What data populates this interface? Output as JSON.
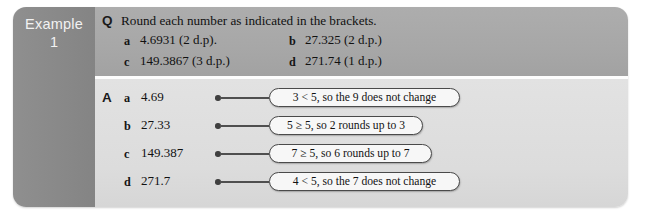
{
  "example_tab": {
    "label": "Example",
    "number": "1"
  },
  "question": {
    "marker": "Q",
    "prompt": "Round each number as indicated in the brackets.",
    "items": [
      {
        "letter": "a",
        "text": "4.6931 (2 d.p)."
      },
      {
        "letter": "b",
        "text": "27.325 (2 d.p.)"
      },
      {
        "letter": "c",
        "text": "149.3867 (3 d.p.)"
      },
      {
        "letter": "d",
        "text": "271.74 (1 d.p.)"
      }
    ]
  },
  "answer": {
    "marker": "A",
    "items": [
      {
        "letter": "a",
        "text": "4.69",
        "note": "3 < 5, so the 9 does not change"
      },
      {
        "letter": "b",
        "text": "27.33",
        "note": "5 ≥ 5, so 2 rounds up to 3"
      },
      {
        "letter": "c",
        "text": "149.387",
        "note": "7 ≥ 5, so 6 rounds up to 7"
      },
      {
        "letter": "d",
        "text": "271.7",
        "note": "4 < 5, so the 7 does not change"
      }
    ]
  },
  "colors": {
    "tab_background": "#8a8a8a",
    "question_background": "#a9a9a9",
    "answer_background": "#dedede",
    "callout_border": "#4a4a4a",
    "callout_background": "#f7f7f7"
  }
}
